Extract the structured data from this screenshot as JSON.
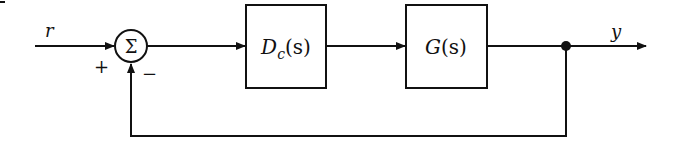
{
  "diagram": {
    "type": "feedback-control-block-diagram",
    "input_label": "r",
    "output_label": "y",
    "summing_junction": {
      "symbol": "Σ",
      "plus_sign": "+",
      "minus_sign": "−"
    },
    "blocks": [
      {
        "id": "controller",
        "main": "D",
        "sub": "c",
        "arg": "(s)"
      },
      {
        "id": "plant",
        "main": "G",
        "sub": "",
        "arg": "(s)"
      }
    ],
    "feedback": "unity negative feedback from output y to summing junction"
  }
}
